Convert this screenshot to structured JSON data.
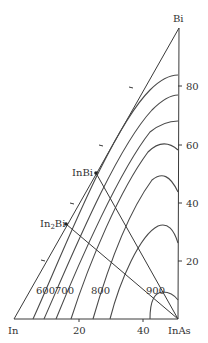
{
  "diagram": {
    "type": "ternary-partial-phase-diagram",
    "vertices": {
      "bottom_left": "In",
      "bottom_right": "InAs",
      "top": "Bi"
    },
    "right_axis_ticks": [
      "80",
      "60",
      "40",
      "20"
    ],
    "bottom_axis_ticks": [
      "20",
      "40"
    ],
    "compounds": [
      {
        "label": "InBi",
        "sub": ""
      },
      {
        "label": "In",
        "sub": "2",
        "suffix": "Bi"
      }
    ],
    "isotherm_labels": [
      "600",
      "700",
      "800",
      "900"
    ],
    "line_color": "#3a3a3a"
  }
}
